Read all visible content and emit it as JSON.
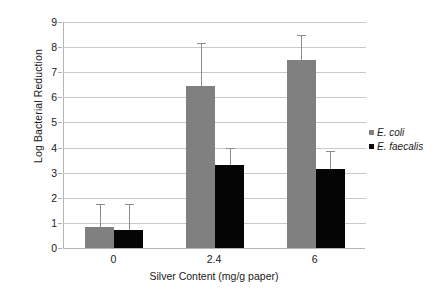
{
  "chart_data": {
    "type": "bar",
    "title": "",
    "xlabel": "Silver Content (mg/g paper)",
    "ylabel": "Log Bacterial Reduction",
    "categories": [
      "0",
      "2.4",
      "6"
    ],
    "ylim": [
      0,
      9
    ],
    "yticks": [
      "0",
      "1",
      "2",
      "3",
      "4",
      "5",
      "6",
      "7",
      "8",
      "9"
    ],
    "grid": true,
    "legend_position": "right",
    "series": [
      {
        "name": "E. coli",
        "color": "#808080",
        "values": [
          0.85,
          6.45,
          7.5
        ],
        "errors": [
          0.9,
          1.7,
          1.0
        ]
      },
      {
        "name": "E. faecalis",
        "color": "#050505",
        "values": [
          0.72,
          3.3,
          3.15
        ],
        "errors": [
          1.05,
          0.7,
          0.7
        ]
      }
    ]
  },
  "legend": {
    "items": [
      {
        "label": "E. coli",
        "swatch": "ecoli"
      },
      {
        "label": "E. faecalis",
        "swatch": "efaecalis"
      }
    ]
  }
}
